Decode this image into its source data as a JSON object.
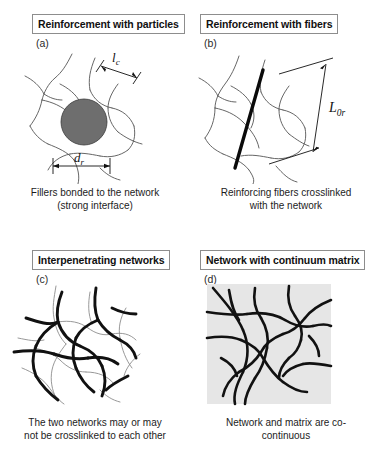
{
  "figure": {
    "background_color": "#ffffff",
    "ink_color": "#111111",
    "particle_fill": "#6e6e6e",
    "matrix_fill": "#e6e6e6",
    "network_thin_color": "#555555",
    "network_thick_color": "#111111"
  },
  "panels": [
    {
      "id": "a",
      "letter": "(a)",
      "title": "Reinforcement with particles",
      "caption_lines": [
        "Fillers bonded to the network",
        "(strong interface)"
      ],
      "annotations": [
        {
          "name": "chain-length-label",
          "text": "l",
          "subscript": "c"
        },
        {
          "name": "particle-diameter-label",
          "text": "d",
          "subscript": "r"
        }
      ]
    },
    {
      "id": "b",
      "letter": "(b)",
      "title": "Reinforcement with fibers",
      "caption_lines": [
        "Reinforcing fibers crosslinked",
        "with the network"
      ],
      "annotations": [
        {
          "name": "fiber-length-label",
          "text": "L",
          "subscript": "0r"
        }
      ]
    },
    {
      "id": "c",
      "letter": "(c)",
      "title": "Interpenetrating networks",
      "caption_lines": [
        "The two networks may or may",
        "not be crosslinked to each other"
      ],
      "annotations": []
    },
    {
      "id": "d",
      "letter": "(d)",
      "title": "Network with continuum matrix",
      "caption_lines": [
        "Network and matrix are co-",
        "continuous"
      ],
      "annotations": []
    }
  ]
}
